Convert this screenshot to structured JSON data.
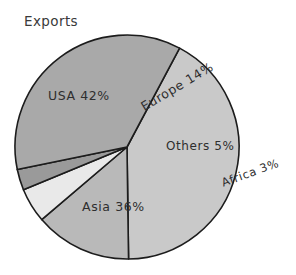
{
  "chart_data": {
    "type": "pie",
    "title": "Exports",
    "xlabel": "",
    "ylabel": "",
    "categories": [
      "USA",
      "Europe",
      "Others",
      "Africa",
      "Asia"
    ],
    "values": [
      42,
      14,
      5,
      3,
      36
    ],
    "value_unit": "%",
    "labels": [
      "USA 42%",
      "Europe 14%",
      "Others 5%",
      "Africa 3%",
      "Asia 36%"
    ],
    "slice_colors": [
      "#c9c9c9",
      "#b9b9b9",
      "#e9e9e9",
      "#9a9a9a",
      "#a9a9a9"
    ],
    "stroke_color": "#1c1c1c",
    "background": "#ffffff",
    "grid": false,
    "legend": "none",
    "label_placement": "inside-and-outside",
    "start_angle_deg": -62,
    "direction": "clockwise",
    "center": {
      "x": 127,
      "y": 147
    },
    "radius": 112,
    "annotations": [
      {
        "text": "USA 42%",
        "rotation_deg": 0,
        "inside": true
      },
      {
        "text": "Europe 14%",
        "rotation_deg": -31,
        "inside": true
      },
      {
        "text": "Others 5%",
        "rotation_deg": 0,
        "inside": true
      },
      {
        "text": "Africa 3%",
        "rotation_deg": -20,
        "inside": false
      },
      {
        "text": "Asia 36%",
        "rotation_deg": 0,
        "inside": true
      }
    ]
  },
  "title": {
    "text": "Exports"
  },
  "slices": {
    "usa": {
      "label": "USA 42%",
      "name": "USA",
      "value": 42,
      "color": "#c9c9c9"
    },
    "europe": {
      "label": "Europe 14%",
      "name": "Europe",
      "value": 14,
      "color": "#b9b9b9"
    },
    "others": {
      "label": "Others 5%",
      "name": "Others",
      "value": 5,
      "color": "#e9e9e9"
    },
    "africa": {
      "label": "Africa 3%",
      "name": "Africa",
      "value": 3,
      "color": "#9a9a9a"
    },
    "asia": {
      "label": "Asia 36%",
      "name": "Asia",
      "value": 36,
      "color": "#a9a9a9"
    }
  }
}
